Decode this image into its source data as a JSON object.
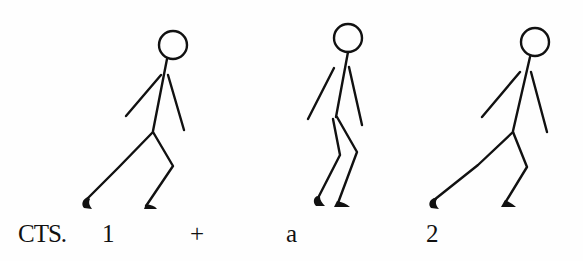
{
  "diagram": {
    "type": "stick-figure step sequence",
    "figures": [
      {
        "id": "figure-1",
        "count": "1",
        "pose": "lunge, back leg extended"
      },
      {
        "id": "figure-2",
        "count": "+",
        "pose": "feet together, knees bent"
      },
      {
        "id": "figure-3",
        "count": "a / 2",
        "pose": "lunge, back leg extended"
      }
    ],
    "counts": {
      "prefix": "CTS.",
      "beats": [
        "1",
        "+",
        "a",
        "2"
      ]
    },
    "colors": {
      "ink": "#111111",
      "background": "#fefefe"
    }
  }
}
